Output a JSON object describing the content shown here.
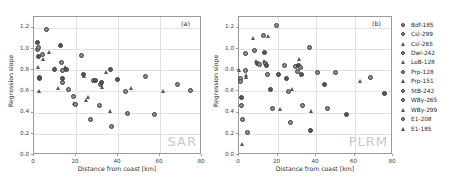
{
  "figure": {
    "watermark_color": "#c9c9c9",
    "marker_color": "#4a4a4a"
  },
  "chart_data": [
    {
      "type": "scatter",
      "panel_tag": "(a)",
      "watermark": "SAR",
      "title": "",
      "xlabel": "Distance from coast [km]",
      "ylabel": "Regression slope",
      "xlim": [
        0,
        80
      ],
      "ylim": [
        0.0,
        1.3
      ],
      "xticks": [
        0,
        20,
        40,
        60,
        80
      ],
      "xticklabels": [
        "0",
        "20",
        "40",
        "60",
        "80"
      ],
      "yticks": [
        0.0,
        0.2,
        0.4,
        0.6,
        0.8,
        1.0,
        1.2
      ],
      "yticklabels": [
        "0.0",
        "0.2",
        "0.4",
        "0.6",
        "0.8",
        "1.0",
        "1.2"
      ],
      "grid": true,
      "legend_position": "outside-right",
      "points": [
        {
          "x": 1.5,
          "y": 1.06,
          "marker": "circle"
        },
        {
          "x": 1.6,
          "y": 0.99,
          "marker": "circle"
        },
        {
          "x": 2.0,
          "y": 1.01,
          "marker": "circle"
        },
        {
          "x": 2.1,
          "y": 0.93,
          "marker": "circle"
        },
        {
          "x": 2.3,
          "y": 0.83,
          "marker": "triangle"
        },
        {
          "x": 2.4,
          "y": 0.73,
          "marker": "circle"
        },
        {
          "x": 2.6,
          "y": 0.72,
          "marker": "circle"
        },
        {
          "x": 2.8,
          "y": 0.6,
          "marker": "triangle"
        },
        {
          "x": 4.2,
          "y": 0.95,
          "marker": "circle"
        },
        {
          "x": 4.4,
          "y": 0.9,
          "marker": "triangle"
        },
        {
          "x": 5.8,
          "y": 1.18,
          "marker": "circle"
        },
        {
          "x": 7.6,
          "y": 0.97,
          "marker": "triangle"
        },
        {
          "x": 9.6,
          "y": 0.81,
          "marker": "circle"
        },
        {
          "x": 10.4,
          "y": 0.82,
          "marker": "triangle"
        },
        {
          "x": 11.6,
          "y": 0.63,
          "marker": "triangle"
        },
        {
          "x": 12.8,
          "y": 1.03,
          "marker": "circle"
        },
        {
          "x": 13.2,
          "y": 0.87,
          "marker": "circle"
        },
        {
          "x": 13.4,
          "y": 0.8,
          "marker": "circle"
        },
        {
          "x": 13.5,
          "y": 0.72,
          "marker": "circle"
        },
        {
          "x": 13.8,
          "y": 0.68,
          "marker": "circle"
        },
        {
          "x": 15.2,
          "y": 0.83,
          "marker": "triangle"
        },
        {
          "x": 15.4,
          "y": 0.81,
          "marker": "circle"
        },
        {
          "x": 16.2,
          "y": 0.62,
          "marker": "circle"
        },
        {
          "x": 18.8,
          "y": 0.55,
          "marker": "circle"
        },
        {
          "x": 19.2,
          "y": 0.49,
          "marker": "triangle"
        },
        {
          "x": 19.6,
          "y": 0.48,
          "marker": "circle"
        },
        {
          "x": 22.8,
          "y": 0.94,
          "marker": "circle"
        },
        {
          "x": 23.6,
          "y": 0.76,
          "marker": "circle"
        },
        {
          "x": 24.2,
          "y": 0.74,
          "marker": "triangle"
        },
        {
          "x": 25.0,
          "y": 0.51,
          "marker": "triangle"
        },
        {
          "x": 26.0,
          "y": 0.54,
          "marker": "triangle"
        },
        {
          "x": 27.0,
          "y": 0.33,
          "marker": "circle"
        },
        {
          "x": 28.4,
          "y": 0.7,
          "marker": "circle"
        },
        {
          "x": 29.2,
          "y": 0.7,
          "marker": "circle"
        },
        {
          "x": 31.0,
          "y": 0.47,
          "marker": "circle"
        },
        {
          "x": 31.6,
          "y": 0.66,
          "marker": "circle"
        },
        {
          "x": 32.2,
          "y": 0.68,
          "marker": "circle"
        },
        {
          "x": 32.6,
          "y": 0.64,
          "marker": "triangle"
        },
        {
          "x": 34.6,
          "y": 0.78,
          "marker": "triangle"
        },
        {
          "x": 36.2,
          "y": 0.81,
          "marker": "circle"
        },
        {
          "x": 36.6,
          "y": 0.41,
          "marker": "triangle"
        },
        {
          "x": 37.0,
          "y": 0.27,
          "marker": "circle"
        },
        {
          "x": 39.8,
          "y": 0.71,
          "marker": "circle"
        },
        {
          "x": 43.4,
          "y": 0.6,
          "marker": "circle"
        },
        {
          "x": 44.6,
          "y": 0.39,
          "marker": "circle"
        },
        {
          "x": 46.6,
          "y": 0.63,
          "marker": "triangle"
        },
        {
          "x": 53.2,
          "y": 0.74,
          "marker": "circle"
        },
        {
          "x": 57.6,
          "y": 0.38,
          "marker": "circle"
        },
        {
          "x": 61.6,
          "y": 0.6,
          "marker": "triangle"
        },
        {
          "x": 68.4,
          "y": 0.66,
          "marker": "circle"
        },
        {
          "x": 74.6,
          "y": 0.61,
          "marker": "circle"
        }
      ]
    },
    {
      "type": "scatter",
      "panel_tag": "(b)",
      "watermark": "PLRM",
      "title": "",
      "xlabel": "Distance from coast [km]",
      "ylabel": "Regression slope",
      "xlim": [
        0,
        80
      ],
      "ylim": [
        0.0,
        1.3
      ],
      "xticks": [
        0,
        20,
        40,
        60,
        80
      ],
      "xticklabels": [
        "0",
        "20",
        "40",
        "60",
        "80"
      ],
      "yticks": [
        0.0,
        0.2,
        0.4,
        0.6,
        0.8,
        1.0,
        1.2
      ],
      "yticklabels": [
        "0.0",
        "0.2",
        "0.4",
        "0.6",
        "0.8",
        "1.0",
        "1.2"
      ],
      "grid": true,
      "legend_position": "outside-right",
      "points": [
        {
          "x": 0.6,
          "y": 0.8,
          "marker": "triangle"
        },
        {
          "x": 0.8,
          "y": 0.72,
          "marker": "circle"
        },
        {
          "x": 1.0,
          "y": 0.69,
          "marker": "circle"
        },
        {
          "x": 1.2,
          "y": 0.54,
          "marker": "circle"
        },
        {
          "x": 1.4,
          "y": 0.47,
          "marker": "circle"
        },
        {
          "x": 1.6,
          "y": 0.33,
          "marker": "circle"
        },
        {
          "x": 1.8,
          "y": 0.1,
          "marker": "triangle"
        },
        {
          "x": 3.4,
          "y": 0.96,
          "marker": "circle"
        },
        {
          "x": 3.6,
          "y": 0.8,
          "marker": "circle"
        },
        {
          "x": 3.8,
          "y": 0.75,
          "marker": "triangle"
        },
        {
          "x": 4.0,
          "y": 0.73,
          "marker": "triangle"
        },
        {
          "x": 4.2,
          "y": 0.21,
          "marker": "circle"
        },
        {
          "x": 7.6,
          "y": 1.1,
          "marker": "triangle"
        },
        {
          "x": 8.2,
          "y": 0.98,
          "marker": "circle"
        },
        {
          "x": 9.4,
          "y": 0.88,
          "marker": "triangle"
        },
        {
          "x": 9.8,
          "y": 0.86,
          "marker": "circle"
        },
        {
          "x": 10.6,
          "y": 0.85,
          "marker": "circle"
        },
        {
          "x": 12.6,
          "y": 1.13,
          "marker": "circle"
        },
        {
          "x": 13.0,
          "y": 0.97,
          "marker": "circle"
        },
        {
          "x": 13.4,
          "y": 0.88,
          "marker": "triangle"
        },
        {
          "x": 13.8,
          "y": 0.86,
          "marker": "circle"
        },
        {
          "x": 14.2,
          "y": 0.84,
          "marker": "circle"
        },
        {
          "x": 14.6,
          "y": 0.76,
          "marker": "circle"
        },
        {
          "x": 15.4,
          "y": 1.12,
          "marker": "triangle"
        },
        {
          "x": 16.2,
          "y": 0.62,
          "marker": "circle"
        },
        {
          "x": 17.4,
          "y": 0.44,
          "marker": "circle"
        },
        {
          "x": 19.6,
          "y": 1.22,
          "marker": "circle"
        },
        {
          "x": 20.4,
          "y": 0.76,
          "marker": "circle"
        },
        {
          "x": 21.6,
          "y": 0.43,
          "marker": "triangle"
        },
        {
          "x": 23.4,
          "y": 0.84,
          "marker": "circle"
        },
        {
          "x": 24.8,
          "y": 0.72,
          "marker": "circle"
        },
        {
          "x": 25.6,
          "y": 0.6,
          "marker": "circle"
        },
        {
          "x": 27.0,
          "y": 0.31,
          "marker": "circle"
        },
        {
          "x": 28.0,
          "y": 0.62,
          "marker": "triangle"
        },
        {
          "x": 29.6,
          "y": 0.83,
          "marker": "circle"
        },
        {
          "x": 30.4,
          "y": 0.79,
          "marker": "circle"
        },
        {
          "x": 30.8,
          "y": 0.84,
          "marker": "circle"
        },
        {
          "x": 31.4,
          "y": 0.9,
          "marker": "triangle"
        },
        {
          "x": 32.0,
          "y": 0.82,
          "marker": "circle"
        },
        {
          "x": 32.4,
          "y": 0.76,
          "marker": "circle"
        },
        {
          "x": 32.8,
          "y": 0.47,
          "marker": "circle"
        },
        {
          "x": 36.4,
          "y": 1.01,
          "marker": "circle"
        },
        {
          "x": 37.0,
          "y": 0.23,
          "marker": "circle"
        },
        {
          "x": 38.0,
          "y": 0.41,
          "marker": "triangle"
        },
        {
          "x": 41.0,
          "y": 0.78,
          "marker": "circle"
        },
        {
          "x": 44.6,
          "y": 0.66,
          "marker": "circle"
        },
        {
          "x": 46.2,
          "y": 0.44,
          "marker": "circle"
        },
        {
          "x": 50.2,
          "y": 0.78,
          "marker": "circle"
        },
        {
          "x": 55.6,
          "y": 0.38,
          "marker": "circle"
        },
        {
          "x": 63.0,
          "y": 0.69,
          "marker": "triangle"
        },
        {
          "x": 68.2,
          "y": 0.73,
          "marker": "circle"
        },
        {
          "x": 75.4,
          "y": 0.58,
          "marker": "circle"
        }
      ]
    }
  ],
  "legend": {
    "entries": [
      {
        "label": "Bdf-185",
        "marker": "circle"
      },
      {
        "label": "Csl-299",
        "marker": "circle"
      },
      {
        "label": "Csl-265",
        "marker": "triangle"
      },
      {
        "label": "Dwl-242",
        "marker": "circle"
      },
      {
        "label": "LoB-128",
        "marker": "triangle"
      },
      {
        "label": "Prp-128",
        "marker": "circle"
      },
      {
        "label": "Prp-151",
        "marker": "triangle"
      },
      {
        "label": "StB-242",
        "marker": "circle"
      },
      {
        "label": "WBy-265",
        "marker": "circle"
      },
      {
        "label": "WBy-299",
        "marker": "triangle"
      },
      {
        "label": "E1-208",
        "marker": "circle"
      },
      {
        "label": "E1-185",
        "marker": "triangle"
      }
    ]
  }
}
